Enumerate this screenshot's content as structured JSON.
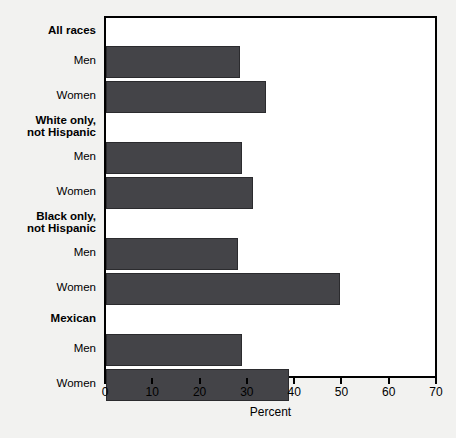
{
  "chart_data": {
    "type": "bar",
    "orientation": "horizontal",
    "title": "",
    "subtitle": "",
    "xlabel": "Percent",
    "ylabel": "",
    "xlim": [
      0,
      70
    ],
    "xticks": [
      0,
      10,
      20,
      30,
      40,
      50,
      60,
      70
    ],
    "xtick_labels": [
      "0",
      "10",
      "20",
      "30",
      "40",
      "50",
      "60",
      "70"
    ],
    "grid": false,
    "legend": false,
    "legend_position": "none",
    "bar_color": "#444448",
    "bar_edge_color": "#2b2b2e",
    "frame_color": "#000000",
    "plot_background": "#ffffff",
    "page_background": "#f2f2f0",
    "groups": [
      {
        "name": "All races",
        "bars": [
          {
            "label": "Men",
            "value": 28.4
          },
          {
            "label": "Women",
            "value": 33.8
          }
        ]
      },
      {
        "name": "White only,\nnot Hispanic",
        "bars": [
          {
            "label": "Men",
            "value": 28.7
          },
          {
            "label": "Women",
            "value": 31.0
          }
        ]
      },
      {
        "name": "Black only,\nnot Hispanic",
        "bars": [
          {
            "label": "Men",
            "value": 27.9
          },
          {
            "label": "Women",
            "value": 49.5
          }
        ]
      },
      {
        "name": "Mexican",
        "bars": [
          {
            "label": "Men",
            "value": 28.7
          },
          {
            "label": "Women",
            "value": 38.6
          }
        ]
      }
    ],
    "categories": [
      "All races - Men",
      "All races - Women",
      "White only, not Hispanic - Men",
      "White only, not Hispanic - Women",
      "Black only, not Hispanic - Men",
      "Black only, not Hispanic - Women",
      "Mexican - Men",
      "Mexican - Women"
    ],
    "values": [
      28.4,
      33.8,
      28.7,
      31.0,
      27.9,
      49.5,
      28.7,
      38.6
    ]
  }
}
